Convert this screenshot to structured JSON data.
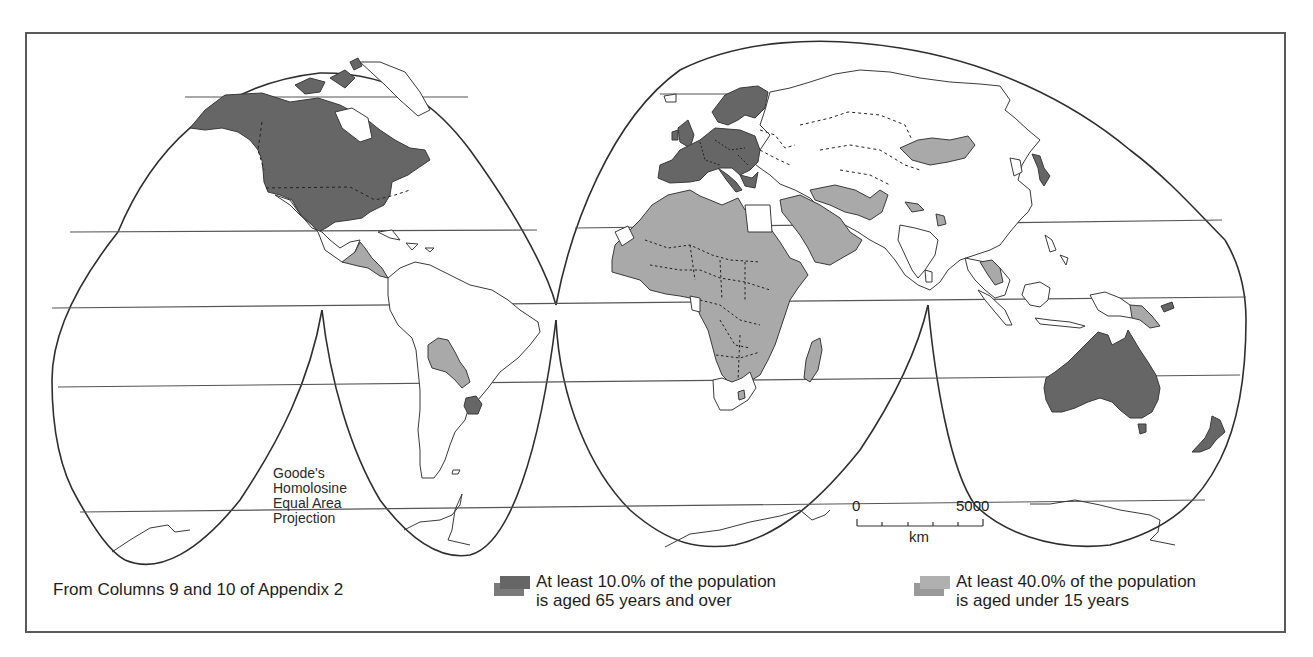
{
  "map": {
    "title": "World map of population age structure",
    "projection_label": [
      "Goode's",
      "Homolosine",
      "Equal Area",
      "Projection"
    ],
    "source_note": "From Columns 9 and 10 of Appendix 2",
    "scale_bar": {
      "start_label": "0",
      "end_label": "5000",
      "unit": "km",
      "ticks": 5
    },
    "colors": {
      "aged_65_plus": "#666666",
      "under_15": "#a9a9a9",
      "land_unshaded": "#ffffff",
      "outline": "#3a3a3a",
      "frame": "#5a5a5a"
    },
    "legend": [
      {
        "key": "aged_65_plus",
        "line1": "At least 10.0% of the population",
        "line2": "is aged 65 years and over",
        "color": "#666666"
      },
      {
        "key": "under_15",
        "line1": "At least 40.0% of the population",
        "line2": "is aged under 15 years",
        "color": "#a9a9a9"
      }
    ],
    "shaded_regions": {
      "aged_65_plus": [
        "Canada",
        "United States",
        "Uruguay",
        "Western Europe",
        "Scandinavia",
        "Japan",
        "Australia",
        "New Zealand"
      ],
      "under_15": [
        "Central America",
        "Paraguay",
        "Bolivia",
        "Africa (most)",
        "Middle East",
        "Mongolia",
        "Pakistan",
        "Nepal",
        "Bangladesh",
        "Laos/Cambodia",
        "Papua New Guinea",
        "Madagascar"
      ]
    }
  }
}
